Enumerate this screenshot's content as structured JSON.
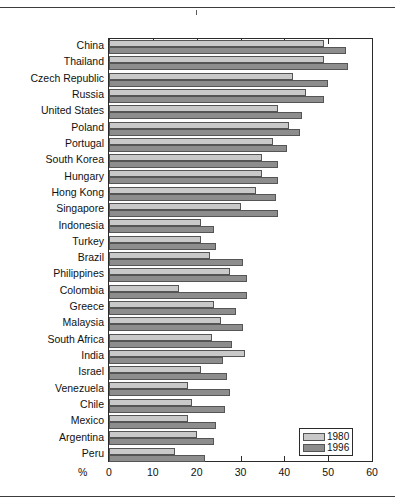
{
  "chart_data": {
    "type": "bar",
    "orientation": "horizontal",
    "title": "",
    "xlabel": "%",
    "ylabel": "",
    "xlim": [
      0,
      60
    ],
    "xticks": [
      0,
      10,
      20,
      30,
      40,
      50,
      60
    ],
    "grid": false,
    "legend_position": "bottom-right",
    "categories": [
      "China",
      "Thailand",
      "Czech Republic",
      "Russia",
      "United States",
      "Poland",
      "Portugal",
      "South Korea",
      "Hungary",
      "Hong Kong",
      "Singapore",
      "Indonesia",
      "Turkey",
      "Brazil",
      "Philippines",
      "Colombia",
      "Greece",
      "Malaysia",
      "South Africa",
      "India",
      "Israel",
      "Venezuela",
      "Chile",
      "Mexico",
      "Argentina",
      "Peru"
    ],
    "series": [
      {
        "name": "1980",
        "color": "#c9c9c9",
        "values": [
          49,
          49,
          42,
          45,
          38.5,
          41,
          37.5,
          35,
          35,
          33.5,
          30,
          21,
          21,
          23,
          27.5,
          16,
          24,
          25.5,
          23.5,
          31,
          21,
          18,
          19,
          18,
          20,
          15
        ]
      },
      {
        "name": "1996",
        "color": "#8d8d8d",
        "values": [
          54,
          54.5,
          50,
          49,
          44,
          43.5,
          40.5,
          38.5,
          38.5,
          38,
          38.5,
          24,
          24.5,
          30.5,
          31.5,
          31.5,
          29,
          30.5,
          28,
          26,
          27,
          27.5,
          26.5,
          24.5,
          24,
          22
        ]
      }
    ]
  },
  "axis": {
    "x_tick_labels": [
      "0",
      "10",
      "20",
      "30",
      "40",
      "50",
      "60"
    ],
    "unit_label": "%"
  },
  "legend": {
    "entries": [
      {
        "label": "1980"
      },
      {
        "label": "1996"
      }
    ]
  }
}
